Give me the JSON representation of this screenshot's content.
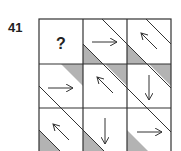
{
  "question_number": "41",
  "grid": {
    "rows": 3,
    "cols": 3,
    "cells": [
      [
        "?",
        "arrow-right",
        "arrow-up-left"
      ],
      [
        "arrow-right",
        "arrow-up-left",
        "arrow-down"
      ],
      [
        "arrow-up-left",
        "arrow-down",
        "arrow-right"
      ]
    ]
  },
  "colors": {
    "line": "#333333",
    "shade": "#b3b3b3",
    "background": "#ffffff"
  },
  "question_mark": "?"
}
